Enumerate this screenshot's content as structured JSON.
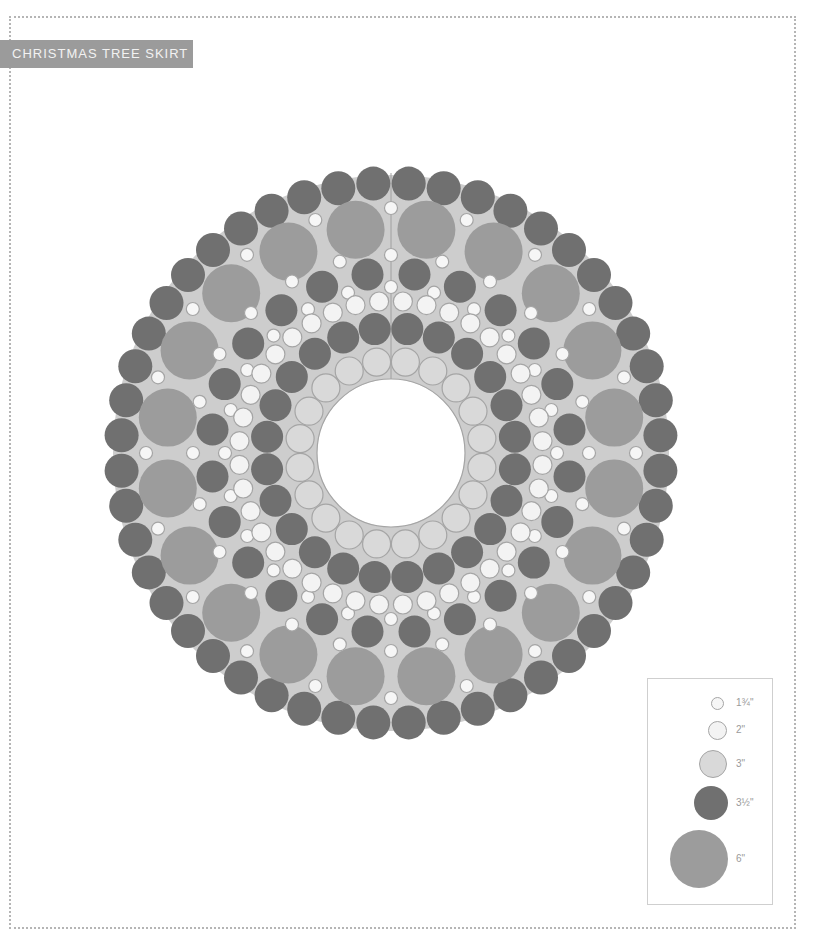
{
  "title": "CHRISTMAS TREE SKIRT",
  "colors": {
    "background_fill": "#cdcdcd",
    "seam": "#a0a0a0",
    "stroke": "#a5a5a5",
    "dark_3_5": "#707070",
    "large_6": "#9c9c9c",
    "light_3": "#d9d9d9",
    "white_2": "#f3f3f3",
    "white_1_75": "#f6f6f6"
  },
  "skirt": {
    "center_x": 391,
    "center_y": 453,
    "outer_radius": 288,
    "hole_radius": 74,
    "rings": [
      {
        "name": "outer-dark-ring",
        "size": "3½\"",
        "radius": 270,
        "diameter": 34,
        "count": 48,
        "offset_deg": 3.75,
        "fill": "dark_3_5",
        "stroke": false
      },
      {
        "name": "outer-white-ring",
        "size": "1¾\"",
        "radius": 245,
        "diameter": 13,
        "count": 20,
        "offset_deg": 0,
        "fill": "white_1_75",
        "stroke": true
      },
      {
        "name": "six-inch-ring",
        "size": "6\"",
        "radius": 226,
        "diameter": 58,
        "count": 20,
        "offset_deg": 9,
        "fill": "large_6",
        "stroke": false
      },
      {
        "name": "mid-white-ring-a",
        "size": "1¾\"",
        "radius": 198,
        "diameter": 13,
        "count": 24,
        "offset_deg": 0,
        "fill": "white_1_75",
        "stroke": true
      },
      {
        "name": "middle-dark-ring",
        "size": "3½\"",
        "radius": 180,
        "diameter": 32,
        "count": 24,
        "offset_deg": 7.5,
        "fill": "dark_3_5",
        "stroke": false
      },
      {
        "name": "mid-white-ring-b",
        "size": "1¾\"",
        "radius": 166,
        "diameter": 13,
        "count": 24,
        "offset_deg": 0,
        "fill": "white_1_75",
        "stroke": true
      },
      {
        "name": "two-inch-ring",
        "size": "2\"",
        "radius": 152,
        "diameter": 19,
        "count": 40,
        "offset_deg": 4.5,
        "fill": "white_2",
        "stroke": true
      },
      {
        "name": "inner-dark-ring",
        "size": "3½\"",
        "radius": 125,
        "diameter": 32,
        "count": 24,
        "offset_deg": 7.5,
        "fill": "dark_3_5",
        "stroke": false
      },
      {
        "name": "inner-three-inch-ring",
        "size": "3\"",
        "radius": 92,
        "diameter": 28,
        "count": 20,
        "offset_deg": 9,
        "fill": "light_3",
        "stroke": true
      }
    ]
  },
  "legend": {
    "items": [
      {
        "label": "1¾\"",
        "diameter": 13,
        "fill": "white_1_75",
        "stroke": true,
        "cx": 717,
        "cy": 703
      },
      {
        "label": "2\"",
        "diameter": 19,
        "fill": "white_2",
        "stroke": true,
        "cx": 717,
        "cy": 730
      },
      {
        "label": "3\"",
        "diameter": 28,
        "fill": "light_3",
        "stroke": true,
        "cx": 713,
        "cy": 764
      },
      {
        "label": "3½\"",
        "diameter": 34,
        "fill": "dark_3_5",
        "stroke": false,
        "cx": 711,
        "cy": 803
      },
      {
        "label": "6\"",
        "diameter": 58,
        "fill": "large_6",
        "stroke": false,
        "cx": 699,
        "cy": 859
      }
    ]
  }
}
